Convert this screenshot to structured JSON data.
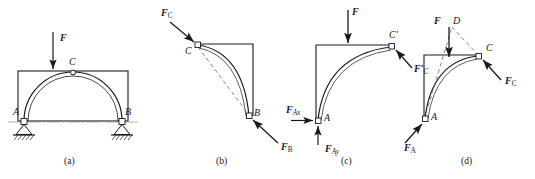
{
  "figure": {
    "ink_color": "#1a1a1a",
    "background_color": "#ffffff",
    "panels": [
      {
        "id": "a",
        "caption": "(a)",
        "description": "Three-hinged arch ACB with vertical load F, pin supports at A and B, hinge at C",
        "points": [
          {
            "label": "A",
            "role": "pin-support-left"
          },
          {
            "label": "B",
            "role": "pin-support-right"
          },
          {
            "label": "C",
            "role": "crown-hinge"
          }
        ],
        "forces": [
          {
            "label": "F",
            "subscript": "",
            "direction": "down",
            "type": "applied-load"
          }
        ],
        "ground": "hatched"
      },
      {
        "id": "b",
        "caption": "(b)",
        "description": "Free-body diagram of right half member CB, two-force member",
        "points": [
          {
            "label": "C",
            "role": "hinge-pin"
          },
          {
            "label": "B",
            "role": "hinge-pin"
          }
        ],
        "forces": [
          {
            "label": "F",
            "subscript": "C",
            "direction": "down-right",
            "type": "pin-reaction"
          },
          {
            "label": "F",
            "subscript": "B",
            "direction": "up-left",
            "type": "pin-reaction"
          }
        ],
        "dashed_line": "line of action C to B"
      },
      {
        "id": "c",
        "caption": "(c)",
        "description": "Free-body diagram of left half member AC with applied load F",
        "points": [
          {
            "label": "A",
            "role": "hinge-pin"
          },
          {
            "label": "C'",
            "role": "hinge-pin"
          }
        ],
        "forces": [
          {
            "label": "F",
            "subscript": "",
            "direction": "down",
            "type": "applied-load"
          },
          {
            "label": "F",
            "subscript": "Ax",
            "direction": "right",
            "type": "support-reaction-x"
          },
          {
            "label": "F",
            "subscript": "Ay",
            "direction": "up",
            "type": "support-reaction-y"
          },
          {
            "label": "F'",
            "subscript": "C",
            "direction": "up-left",
            "type": "pin-reaction"
          }
        ]
      },
      {
        "id": "d",
        "caption": "(d)",
        "description": "Three-force member AC, concurrent force solution through point D",
        "points": [
          {
            "label": "A",
            "role": "hinge-pin"
          },
          {
            "label": "C",
            "role": "hinge-pin"
          },
          {
            "label": "D",
            "role": "concurrency-point"
          }
        ],
        "forces": [
          {
            "label": "F",
            "subscript": "",
            "direction": "down",
            "type": "applied-load"
          },
          {
            "label": "F",
            "subscript": "A",
            "direction": "up-right",
            "type": "support-reaction"
          },
          {
            "label": "F",
            "subscript": "C",
            "direction": "up-left",
            "type": "pin-reaction"
          }
        ],
        "dashed_lines": "A to D and D to C concurrency construction"
      }
    ]
  },
  "labels": {
    "a": {
      "caption": "(a)",
      "pt_A": "A",
      "pt_B": "B",
      "pt_C": "C",
      "force_F": "F"
    },
    "b": {
      "caption": "(b)",
      "pt_C": "C",
      "pt_B": "B",
      "force_FC_main": "F",
      "force_FC_sub": "C",
      "force_FB_main": "F",
      "force_FB_sub": "B"
    },
    "c": {
      "caption": "(c)",
      "pt_A": "A",
      "pt_Cp": "C′",
      "force_F": "F",
      "force_FAx_main": "F",
      "force_FAx_sub": "Ax",
      "force_FAy_main": "F",
      "force_FAy_sub": "Ay",
      "force_FpC_main": "F′",
      "force_FpC_sub": "C"
    },
    "d": {
      "caption": "(d)",
      "pt_A": "A",
      "pt_C": "C",
      "pt_D": "D",
      "force_F": "F",
      "force_FA_main": "F",
      "force_FA_sub": "A",
      "force_FC_main": "F",
      "force_FC_sub": "C"
    }
  }
}
